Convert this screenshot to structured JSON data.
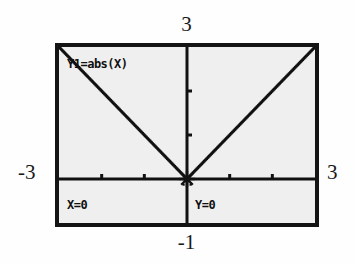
{
  "device": {
    "kind": "graphing-calculator-screen",
    "frame_color": "#141414",
    "screen_background": "#efefef",
    "trace_mode": true
  },
  "axis_labels": {
    "y_max": "3",
    "y_min": "-1",
    "x_min": "-3",
    "x_max": "3"
  },
  "screen_overlays": {
    "function_label": "Y1=abs(X)",
    "x_readout": "X=0",
    "y_readout": "Y=0"
  },
  "chart_data": {
    "type": "line",
    "title": "Y1=abs(X)",
    "subtitle": "",
    "xlabel": "",
    "ylabel": "",
    "xlim": [
      -3,
      3
    ],
    "ylim": [
      -1,
      3
    ],
    "grid": false,
    "legend": "none",
    "axes": {
      "x_axis_y": 0,
      "y_axis_x": 0,
      "x_tick_step": 1,
      "y_tick_step": 1,
      "x_ticks": [
        -2,
        -1,
        1,
        2
      ],
      "y_ticks": [
        1,
        2
      ],
      "tick_length_px": 5
    },
    "series": [
      {
        "name": "Y1=abs(X)",
        "equation": "y = |x|",
        "style": "dotted",
        "color": "#111111",
        "x": [
          -3,
          -2.5,
          -2,
          -1.5,
          -1,
          -0.5,
          0,
          0.5,
          1,
          1.5,
          2,
          2.5,
          3
        ],
        "values": [
          3,
          2.5,
          2,
          1.5,
          1,
          0.5,
          0,
          0.5,
          1,
          1.5,
          2,
          2.5,
          3
        ]
      }
    ],
    "annotations": [
      {
        "name": "trace-cursor",
        "label": "X=0  Y=0",
        "x": 0,
        "y": 0,
        "marker": "star-cross"
      }
    ]
  }
}
